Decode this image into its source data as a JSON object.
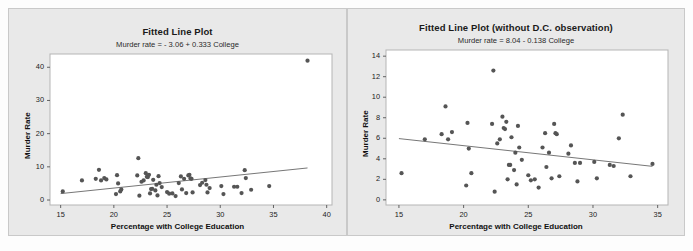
{
  "figure": {
    "background_color": "#e9e9e9",
    "plot_background_color": "#ffffff",
    "marker_color": "#555555",
    "line_color": "#777777"
  },
  "chart_data": [
    {
      "type": "scatter",
      "panel": "left",
      "title": "Fitted Line Plot",
      "subtitle": "Murder rate =  - 3.06 + 0.333 College",
      "xlabel": "Percentage with College Education",
      "ylabel": "Murder Rate",
      "xlim": [
        14,
        40.5
      ],
      "ylim": [
        -1.5,
        44
      ],
      "xticks": [
        15,
        20,
        25,
        30,
        35,
        40
      ],
      "yticks": [
        0,
        10,
        20,
        30,
        40
      ],
      "grid": false,
      "legend": "none",
      "fit_line": {
        "intercept": -3.06,
        "slope": 0.333,
        "x_start": 15.0,
        "x_end": 38.2
      },
      "points": [
        [
          15.2,
          2.6
        ],
        [
          17.0,
          5.9
        ],
        [
          18.3,
          6.4
        ],
        [
          18.6,
          9.1
        ],
        [
          18.8,
          5.9
        ],
        [
          19.1,
          6.6
        ],
        [
          19.3,
          6.2
        ],
        [
          20.2,
          1.8
        ],
        [
          20.3,
          7.5
        ],
        [
          20.4,
          5.0
        ],
        [
          20.6,
          2.6
        ],
        [
          20.7,
          3.2
        ],
        [
          22.2,
          7.4
        ],
        [
          22.3,
          12.6
        ],
        [
          22.4,
          1.3
        ],
        [
          22.6,
          5.5
        ],
        [
          22.8,
          5.9
        ],
        [
          23.0,
          8.1
        ],
        [
          23.1,
          7.0
        ],
        [
          23.2,
          6.9
        ],
        [
          23.3,
          7.6
        ],
        [
          23.4,
          2.0
        ],
        [
          23.5,
          3.3
        ],
        [
          23.6,
          3.4
        ],
        [
          23.7,
          6.1
        ],
        [
          23.9,
          2.9
        ],
        [
          24.0,
          4.6
        ],
        [
          24.1,
          1.4
        ],
        [
          24.2,
          7.2
        ],
        [
          24.3,
          5.1
        ],
        [
          24.5,
          3.9
        ],
        [
          25.0,
          2.4
        ],
        [
          25.2,
          1.9
        ],
        [
          25.5,
          2.0
        ],
        [
          25.8,
          1.2
        ],
        [
          26.1,
          5.1
        ],
        [
          26.3,
          7.1
        ],
        [
          26.4,
          3.2
        ],
        [
          26.6,
          6.4
        ],
        [
          26.8,
          2.1
        ],
        [
          27.0,
          7.4
        ],
        [
          27.1,
          7.6
        ],
        [
          27.2,
          6.5
        ],
        [
          27.3,
          6.4
        ],
        [
          27.4,
          2.3
        ],
        [
          28.1,
          4.5
        ],
        [
          28.3,
          5.2
        ],
        [
          28.6,
          6.0
        ],
        [
          28.7,
          4.6
        ],
        [
          28.8,
          2.3
        ],
        [
          29.0,
          3.6
        ],
        [
          30.1,
          4.2
        ],
        [
          30.3,
          1.8
        ],
        [
          31.3,
          4.0
        ],
        [
          31.6,
          4.0
        ],
        [
          32.0,
          2.1
        ],
        [
          32.3,
          9.0
        ],
        [
          32.4,
          6.6
        ],
        [
          32.9,
          3.1
        ],
        [
          34.6,
          4.2
        ],
        [
          38.2,
          42.0
        ]
      ]
    },
    {
      "type": "scatter",
      "panel": "right",
      "title": "Fitted Line Plot (without D.C. observation)",
      "subtitle": "Murder rate =  8.04 - 0.138 College",
      "xlabel": "Percentage with College Education",
      "ylabel": "Murder Rate",
      "xlim": [
        14,
        35.8
      ],
      "ylim": [
        -0.5,
        14.6
      ],
      "xticks": [
        15,
        20,
        25,
        30,
        35
      ],
      "yticks": [
        0,
        2,
        4,
        6,
        8,
        10,
        12,
        14
      ],
      "grid": false,
      "legend": "none",
      "fit_line": {
        "intercept": 8.04,
        "slope": -0.138,
        "x_start": 15.0,
        "x_end": 34.6
      },
      "points": [
        [
          15.2,
          2.6
        ],
        [
          17.0,
          5.9
        ],
        [
          18.3,
          6.4
        ],
        [
          18.6,
          9.1
        ],
        [
          18.8,
          5.9
        ],
        [
          19.1,
          6.6
        ],
        [
          20.2,
          1.4
        ],
        [
          20.3,
          7.5
        ],
        [
          20.4,
          5.0
        ],
        [
          20.6,
          2.6
        ],
        [
          22.2,
          7.4
        ],
        [
          22.3,
          12.6
        ],
        [
          22.4,
          0.8
        ],
        [
          22.6,
          5.5
        ],
        [
          22.8,
          5.9
        ],
        [
          23.0,
          8.1
        ],
        [
          23.1,
          7.0
        ],
        [
          23.2,
          6.9
        ],
        [
          23.3,
          7.6
        ],
        [
          23.4,
          2.0
        ],
        [
          23.5,
          3.4
        ],
        [
          23.6,
          3.4
        ],
        [
          23.7,
          6.1
        ],
        [
          23.9,
          2.9
        ],
        [
          24.0,
          4.6
        ],
        [
          24.1,
          1.5
        ],
        [
          24.2,
          7.2
        ],
        [
          24.3,
          5.1
        ],
        [
          24.5,
          3.9
        ],
        [
          25.0,
          2.4
        ],
        [
          25.2,
          1.9
        ],
        [
          25.5,
          2.0
        ],
        [
          25.8,
          1.2
        ],
        [
          26.1,
          5.1
        ],
        [
          26.3,
          6.5
        ],
        [
          26.4,
          3.2
        ],
        [
          26.6,
          4.6
        ],
        [
          26.8,
          2.1
        ],
        [
          27.0,
          7.4
        ],
        [
          27.1,
          6.5
        ],
        [
          27.2,
          6.4
        ],
        [
          27.4,
          2.3
        ],
        [
          28.1,
          4.5
        ],
        [
          28.3,
          5.3
        ],
        [
          28.6,
          3.6
        ],
        [
          28.8,
          1.8
        ],
        [
          29.0,
          3.6
        ],
        [
          30.1,
          3.7
        ],
        [
          30.3,
          2.1
        ],
        [
          31.3,
          3.4
        ],
        [
          31.6,
          3.3
        ],
        [
          32.0,
          6.0
        ],
        [
          32.3,
          8.3
        ],
        [
          32.9,
          2.3
        ],
        [
          34.6,
          3.5
        ]
      ]
    }
  ]
}
